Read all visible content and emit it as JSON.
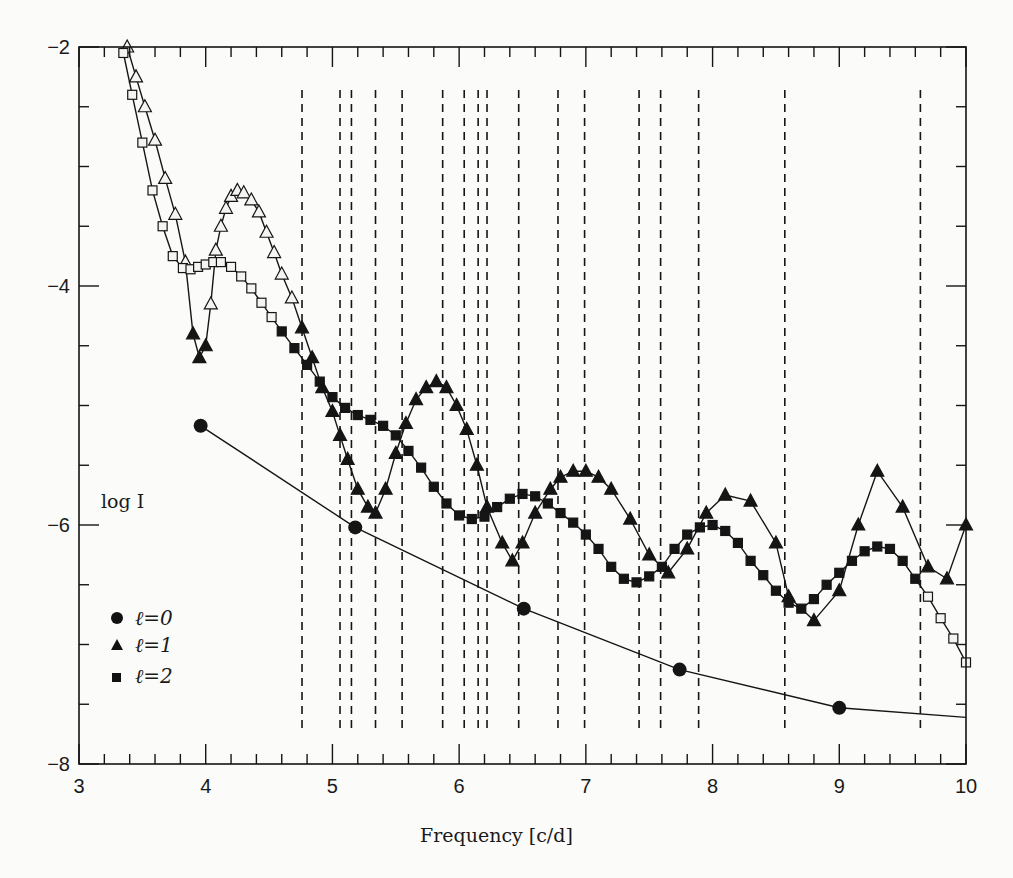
{
  "chart_data": {
    "type": "line",
    "title": "",
    "xlabel": "Frequency [c/d]",
    "ylabel": "log I",
    "xlim": [
      3,
      10
    ],
    "ylim": [
      -8,
      -2
    ],
    "x_ticks": [
      3,
      4,
      5,
      6,
      7,
      8,
      9,
      10
    ],
    "x_tick_labels": [
      "3",
      "4",
      "5",
      "6",
      "7",
      "8",
      "9",
      "10"
    ],
    "x_minor_step": 0.2,
    "y_ticks": [
      -8,
      -6,
      -4,
      -2
    ],
    "y_tick_labels": [
      "−8",
      "−6",
      "−4",
      "−2"
    ],
    "y_minor_step": 0.5,
    "grid": false,
    "legend_position": "lower-left (inside)",
    "legend": [
      {
        "label": "ℓ=0",
        "marker": "circle"
      },
      {
        "label": "ℓ=1",
        "marker": "triangle"
      },
      {
        "label": "ℓ=2",
        "marker": "square"
      }
    ],
    "observed_frequencies_dashed": [
      4.76,
      5.06,
      5.15,
      5.34,
      5.55,
      5.87,
      6.04,
      6.15,
      6.22,
      6.47,
      6.78,
      6.99,
      7.42,
      7.59,
      7.89,
      8.57,
      9.64
    ],
    "series": [
      {
        "name": "ℓ=0",
        "marker": "circle",
        "x": [
          3.96,
          5.18,
          6.51,
          7.74,
          9.0,
          10.0
        ],
        "y": [
          -5.17,
          -6.02,
          -6.7,
          -7.21,
          -7.53,
          -7.61
        ],
        "marker_count": 5
      },
      {
        "name": "ℓ=1",
        "marker": "triangle",
        "x": [
          3.38,
          3.45,
          3.52,
          3.6,
          3.68,
          3.76,
          3.84,
          3.9,
          3.95,
          4.0,
          4.04,
          4.08,
          4.12,
          4.16,
          4.2,
          4.25,
          4.3,
          4.36,
          4.42,
          4.48,
          4.54,
          4.6,
          4.68,
          4.76,
          4.84,
          4.92,
          5.0,
          5.06,
          5.12,
          5.2,
          5.28,
          5.34,
          5.42,
          5.5,
          5.58,
          5.66,
          5.74,
          5.82,
          5.9,
          5.98,
          6.06,
          6.14,
          6.22,
          6.34,
          6.42,
          6.5,
          6.6,
          6.72,
          6.8,
          6.9,
          7.0,
          7.1,
          7.2,
          7.35,
          7.5,
          7.65,
          7.8,
          7.95,
          8.1,
          8.3,
          8.5,
          8.6,
          8.8,
          9.0,
          9.15,
          9.3,
          9.5,
          9.7,
          9.85,
          10.0
        ],
        "y": [
          -2.0,
          -2.25,
          -2.5,
          -2.78,
          -3.1,
          -3.4,
          -3.8,
          -4.4,
          -4.6,
          -4.5,
          -4.15,
          -3.7,
          -3.5,
          -3.35,
          -3.25,
          -3.2,
          -3.22,
          -3.28,
          -3.38,
          -3.55,
          -3.72,
          -3.9,
          -4.1,
          -4.35,
          -4.6,
          -4.85,
          -5.05,
          -5.25,
          -5.45,
          -5.7,
          -5.85,
          -5.9,
          -5.7,
          -5.4,
          -5.15,
          -4.95,
          -4.85,
          -4.8,
          -4.85,
          -5.0,
          -5.2,
          -5.5,
          -5.85,
          -6.15,
          -6.3,
          -6.15,
          -5.9,
          -5.7,
          -5.6,
          -5.55,
          -5.55,
          -5.6,
          -5.7,
          -5.95,
          -6.25,
          -6.4,
          -6.2,
          -5.9,
          -5.75,
          -5.8,
          -6.15,
          -6.6,
          -6.8,
          -6.55,
          -6.0,
          -5.55,
          -5.85,
          -6.35,
          -6.45,
          -6.0
        ],
        "right_end": [
          10.0,
          -5.95
        ]
      },
      {
        "name": "ℓ=2",
        "marker": "square",
        "x": [
          3.35,
          3.42,
          3.5,
          3.58,
          3.66,
          3.74,
          3.82,
          3.88,
          3.94,
          4.0,
          4.06,
          4.12,
          4.2,
          4.28,
          4.36,
          4.44,
          4.52,
          4.6,
          4.7,
          4.8,
          4.9,
          5.0,
          5.1,
          5.2,
          5.3,
          5.4,
          5.5,
          5.6,
          5.7,
          5.8,
          5.9,
          6.0,
          6.1,
          6.2,
          6.3,
          6.4,
          6.5,
          6.6,
          6.7,
          6.8,
          6.9,
          7.0,
          7.1,
          7.2,
          7.3,
          7.4,
          7.5,
          7.6,
          7.7,
          7.8,
          7.9,
          8.0,
          8.1,
          8.2,
          8.3,
          8.4,
          8.5,
          8.6,
          8.7,
          8.8,
          8.9,
          9.0,
          9.1,
          9.2,
          9.3,
          9.4,
          9.5,
          9.6,
          9.7,
          9.8,
          9.9,
          10.0
        ],
        "y": [
          -2.05,
          -2.4,
          -2.8,
          -3.2,
          -3.5,
          -3.75,
          -3.85,
          -3.86,
          -3.84,
          -3.82,
          -3.8,
          -3.8,
          -3.84,
          -3.92,
          -4.02,
          -4.14,
          -4.26,
          -4.38,
          -4.52,
          -4.66,
          -4.8,
          -4.93,
          -5.02,
          -5.08,
          -5.12,
          -5.17,
          -5.25,
          -5.38,
          -5.52,
          -5.68,
          -5.82,
          -5.92,
          -5.95,
          -5.93,
          -5.85,
          -5.78,
          -5.74,
          -5.76,
          -5.82,
          -5.9,
          -5.98,
          -6.08,
          -6.2,
          -6.35,
          -6.45,
          -6.48,
          -6.43,
          -6.35,
          -6.2,
          -6.08,
          -6.02,
          -6.0,
          -6.05,
          -6.15,
          -6.3,
          -6.42,
          -6.55,
          -6.65,
          -6.7,
          -6.62,
          -6.5,
          -6.4,
          -6.3,
          -6.22,
          -6.18,
          -6.2,
          -6.3,
          -6.45,
          -6.6,
          -6.78,
          -6.95,
          -7.15
        ]
      }
    ]
  },
  "axes": {
    "x_title": "Frequency [c/d]",
    "y_title": "log I"
  },
  "legend": {
    "items": [
      {
        "label": "ℓ=0"
      },
      {
        "label": "ℓ=1"
      },
      {
        "label": "ℓ=2"
      }
    ]
  }
}
